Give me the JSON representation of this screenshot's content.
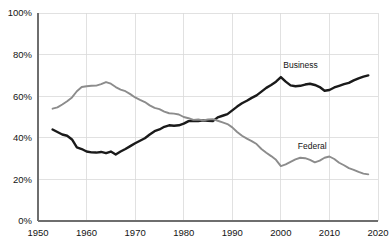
{
  "chart_data": {
    "type": "line",
    "title": "",
    "subtitle": "",
    "xlabel": "",
    "ylabel": "",
    "xlim": [
      1950,
      2020
    ],
    "ylim": [
      0,
      100
    ],
    "grid": true,
    "legend_position": "inline-annotation",
    "x_ticks": [
      "1950",
      "1960",
      "1970",
      "1980",
      "1990",
      "2000",
      "2010",
      "2020"
    ],
    "x_tick_values": [
      1950,
      1960,
      1970,
      1980,
      1990,
      2000,
      2010,
      2020
    ],
    "y_ticks": [
      "0%",
      "20%",
      "40%",
      "60%",
      "80%",
      "100%"
    ],
    "y_tick_values": [
      0,
      20,
      40,
      60,
      80,
      100
    ],
    "series": [
      {
        "name": "Business",
        "color": "#1a1a1a",
        "width": 2.4,
        "label_x": 2000.5,
        "label_y": 73.5,
        "x": [
          1953,
          1954,
          1955,
          1956,
          1957,
          1958,
          1959,
          1960,
          1961,
          1962,
          1963,
          1964,
          1965,
          1966,
          1967,
          1968,
          1969,
          1970,
          1971,
          1972,
          1973,
          1974,
          1975,
          1976,
          1977,
          1978,
          1979,
          1980,
          1981,
          1982,
          1983,
          1984,
          1985,
          1986,
          1987,
          1988,
          1989,
          1990,
          1991,
          1992,
          1993,
          1994,
          1995,
          1996,
          1997,
          1998,
          1999,
          2000,
          2001,
          2002,
          2003,
          2004,
          2005,
          2006,
          2007,
          2008,
          2009,
          2010,
          2011,
          2012,
          2013,
          2014,
          2015,
          2016,
          2017,
          2018
        ],
        "values": [
          44.0,
          42.8,
          41.6,
          41.0,
          39.2,
          35.4,
          34.6,
          33.4,
          33.0,
          32.9,
          33.2,
          32.6,
          33.4,
          32.0,
          33.4,
          34.6,
          36.0,
          37.4,
          38.6,
          39.8,
          41.6,
          43.2,
          44.0,
          45.3,
          46.0,
          45.8,
          46.0,
          46.8,
          48.0,
          48.2,
          48.1,
          48.4,
          48.2,
          48.0,
          49.8,
          50.6,
          51.4,
          53.2,
          55.0,
          56.6,
          57.8,
          59.2,
          60.4,
          62.2,
          64.0,
          65.4,
          67.0,
          69.2,
          67.0,
          65.2,
          64.8,
          65.0,
          65.6,
          66.0,
          65.4,
          64.4,
          62.6,
          63.0,
          64.2,
          65.0,
          65.8,
          66.4,
          67.6,
          68.6,
          69.4,
          70.0
        ]
      },
      {
        "name": "Federal",
        "color": "#8c8c8c",
        "width": 1.9,
        "label_x": 2003.5,
        "label_y": 34.5,
        "x": [
          1953,
          1954,
          1955,
          1956,
          1957,
          1958,
          1959,
          1960,
          1961,
          1962,
          1963,
          1964,
          1965,
          1966,
          1967,
          1968,
          1969,
          1970,
          1971,
          1972,
          1973,
          1974,
          1975,
          1976,
          1977,
          1978,
          1979,
          1980,
          1981,
          1982,
          1983,
          1984,
          1985,
          1986,
          1987,
          1988,
          1989,
          1990,
          1991,
          1992,
          1993,
          1994,
          1995,
          1996,
          1997,
          1998,
          1999,
          2000,
          2001,
          2002,
          2003,
          2004,
          2005,
          2006,
          2007,
          2008,
          2009,
          2010,
          2011,
          2012,
          2013,
          2014,
          2015,
          2016,
          2017,
          2018
        ],
        "values": [
          54.0,
          54.6,
          56.0,
          57.6,
          59.4,
          62.4,
          64.4,
          64.8,
          65.0,
          65.1,
          65.8,
          66.8,
          66.0,
          64.4,
          63.2,
          62.4,
          61.0,
          59.4,
          58.2,
          57.2,
          55.6,
          54.4,
          53.8,
          52.6,
          51.8,
          51.6,
          51.2,
          50.0,
          49.4,
          48.6,
          48.8,
          48.4,
          48.8,
          49.0,
          48.2,
          47.4,
          46.6,
          45.0,
          42.8,
          41.0,
          39.6,
          38.4,
          37.0,
          34.6,
          32.8,
          31.2,
          29.4,
          26.4,
          27.2,
          28.4,
          29.6,
          30.4,
          30.2,
          29.4,
          28.2,
          29.0,
          30.4,
          31.0,
          29.8,
          28.0,
          26.8,
          25.4,
          24.6,
          23.6,
          22.8,
          22.4
        ]
      }
    ]
  },
  "axes": {
    "y_axis_name": "percent-axis",
    "x_axis_name": "year-axis"
  },
  "colors": {
    "background": "#ffffff",
    "gridline": "#d9d9d9",
    "axis": "#6e6e6e",
    "text": "#141414",
    "business": "#1a1a1a",
    "federal": "#8c8c8c"
  }
}
